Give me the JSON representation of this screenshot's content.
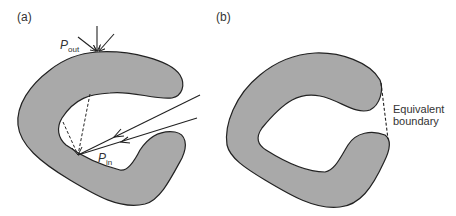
{
  "panels": [
    {
      "id": "a",
      "label": "(a)",
      "annotations": {
        "p_out": {
          "base": "P",
          "sub": "out"
        },
        "p_in": {
          "base": "P",
          "sub": "in"
        }
      }
    },
    {
      "id": "b",
      "label": "(b)",
      "annotations": {
        "equivalent_boundary_line1": "Equivalent",
        "equivalent_boundary_line2": "boundary"
      }
    }
  ],
  "colors": {
    "shape_fill": "#a9a9a9",
    "stroke": "#222222",
    "text": "#333333"
  }
}
